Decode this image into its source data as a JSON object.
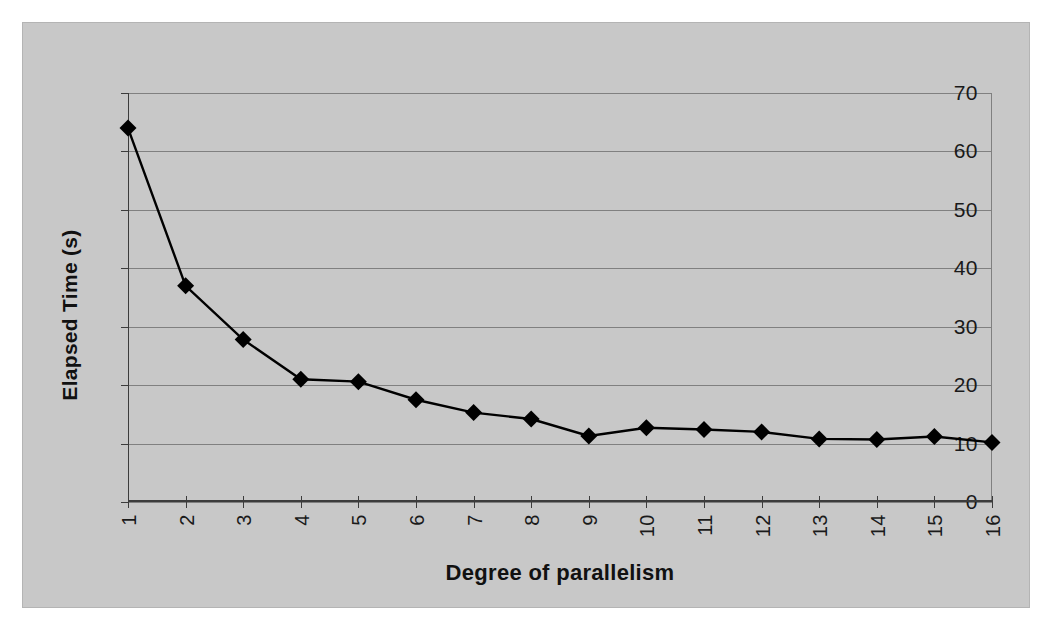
{
  "chart_data": {
    "type": "line",
    "title": "",
    "xlabel": "Degree of parallelism",
    "ylabel": "Elapsed Time (s)",
    "categories": [
      1,
      2,
      3,
      4,
      5,
      6,
      7,
      8,
      9,
      10,
      11,
      12,
      13,
      14,
      15,
      16
    ],
    "xtick_labels": [
      "1",
      "2",
      "3",
      "4",
      "5",
      "6",
      "7",
      "8",
      "9",
      "10",
      "11",
      "12",
      "13",
      "14",
      "15",
      "16"
    ],
    "values": [
      64.0,
      37.0,
      27.8,
      21.0,
      20.6,
      17.5,
      15.3,
      14.2,
      11.3,
      12.7,
      12.4,
      12.0,
      10.8,
      10.7,
      11.2,
      10.2
    ],
    "series": [
      {
        "name": "Elapsed Time (s)",
        "values": [
          64.0,
          37.0,
          27.8,
          21.0,
          20.6,
          17.5,
          15.3,
          14.2,
          11.3,
          12.7,
          12.4,
          12.0,
          10.8,
          10.7,
          11.2,
          10.2
        ]
      }
    ],
    "ylim": [
      0,
      70
    ],
    "yticks": [
      0,
      10,
      20,
      30,
      40,
      50,
      60,
      70
    ],
    "ytick_labels": [
      "0",
      "10",
      "20",
      "30",
      "40",
      "50",
      "60",
      "70"
    ],
    "xlim": [
      1,
      16
    ],
    "grid": "horizontal",
    "legend": "none",
    "marker": "diamond",
    "colors": {
      "plot_background": "#c8c8c8",
      "page_background": "#ffffff",
      "line": "#000000",
      "marker": "#000000",
      "gridline": "#808080",
      "axis": "#3c3c3c",
      "text": "#111111"
    }
  }
}
